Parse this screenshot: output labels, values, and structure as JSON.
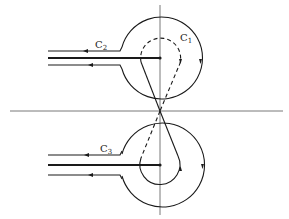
{
  "diagram": {
    "type": "contour-integration-keyhole",
    "colors": {
      "stroke": "#1a1a1a",
      "background": "#ffffff",
      "axis": "#555555"
    },
    "labels": {
      "c1": {
        "main": "C",
        "sub": "1"
      },
      "c2": {
        "main": "C",
        "sub": "2"
      },
      "c3": {
        "main": "C",
        "sub": "3"
      }
    },
    "top_contour": {
      "center": [
        160,
        58
      ],
      "outer_radius": 41,
      "inner_radius": 20,
      "inner_style": "dashed",
      "outer_arrow": "down",
      "inner_arrow": "down",
      "channel_arrows": [
        "left",
        "left"
      ]
    },
    "bottom_contour": {
      "center": [
        160,
        165
      ],
      "outer_radius": 42,
      "inner_radius": 20,
      "inner_style": "solid",
      "outer_arrow": "down",
      "inner_arrow": "up",
      "channel_arrows": [
        "left",
        "left"
      ]
    },
    "real_axis_y": 111,
    "imag_axis_x": 160
  }
}
